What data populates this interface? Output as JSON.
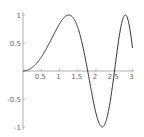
{
  "chart_data": {
    "type": "line",
    "title": "",
    "xlabel": "",
    "ylabel": "",
    "function": "sin(x^2)",
    "xlim": [
      0,
      3
    ],
    "ylim": [
      -1,
      1
    ],
    "grid": false,
    "legend": null,
    "x_ticks": [
      0.5,
      1,
      1.5,
      2,
      2.5,
      3
    ],
    "x_tick_labels": [
      "0.5",
      "1",
      "1.5",
      "2",
      "2.5",
      "3"
    ],
    "y_ticks": [
      -1,
      -0.5,
      0.5,
      1
    ],
    "y_tick_labels": [
      "-1",
      "-0.5",
      "0.5",
      "1"
    ],
    "series": [
      {
        "name": "sin(x^2)",
        "color": "#333333",
        "x": [
          0,
          0.25,
          0.5,
          0.75,
          1.0,
          1.25,
          1.5,
          1.75,
          2.0,
          2.25,
          2.5,
          2.75,
          3.0
        ],
        "values": [
          0,
          0.062,
          0.247,
          0.534,
          0.841,
          0.999,
          0.778,
          0.08,
          -0.757,
          -0.948,
          -0.033,
          0.958,
          0.412
        ]
      }
    ]
  },
  "colors": {
    "axis": "#999999",
    "curve": "#333333",
    "label": "#666666"
  }
}
